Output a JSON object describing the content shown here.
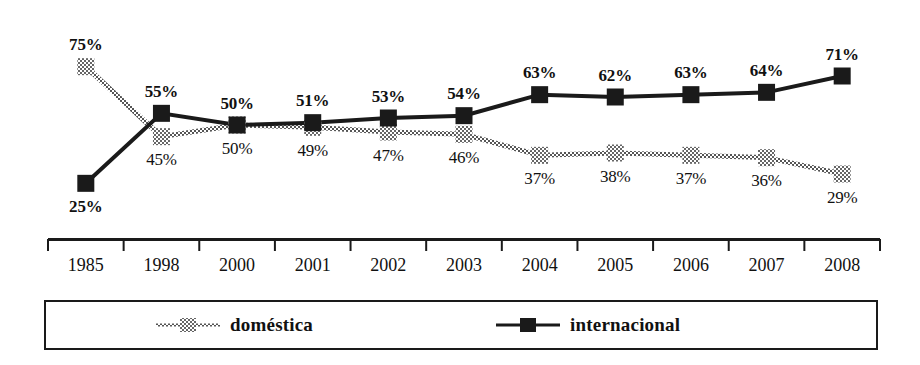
{
  "chart_data": {
    "type": "line",
    "title": "",
    "subtitle": "",
    "xlabel": "",
    "ylabel": "",
    "ylim": [
      20,
      80
    ],
    "grid": false,
    "legend_position": "bottom",
    "value_suffix": "%",
    "categories": [
      "1985",
      "1998",
      "2000",
      "2001",
      "2002",
      "2003",
      "2004",
      "2005",
      "2006",
      "2007",
      "2008"
    ],
    "series": [
      {
        "name": "doméstica",
        "marker": "hatched-square",
        "color": "#8a8a8a",
        "values": [
          75,
          45,
          50,
          49,
          47,
          46,
          37,
          38,
          37,
          36,
          29
        ],
        "labels": [
          "75%",
          "45%",
          "50%",
          "49%",
          "47%",
          "46%",
          "37%",
          "38%",
          "37%",
          "36%",
          "29%"
        ],
        "label_positions": [
          "above",
          "below",
          "below",
          "below",
          "below",
          "below",
          "below",
          "below",
          "below",
          "below",
          "below"
        ],
        "label_bold": [
          true,
          false,
          false,
          false,
          false,
          false,
          false,
          false,
          false,
          false,
          false
        ]
      },
      {
        "name": "internacional",
        "marker": "solid-square",
        "color": "#1a1a1a",
        "values": [
          25,
          55,
          50,
          51,
          53,
          54,
          63,
          62,
          63,
          64,
          71
        ],
        "labels": [
          "25%",
          "55%",
          "50%",
          "51%",
          "53%",
          "54%",
          "63%",
          "62%",
          "63%",
          "64%",
          "71%"
        ],
        "label_positions": [
          "below",
          "above",
          "above",
          "above",
          "above",
          "above",
          "above",
          "above",
          "above",
          "above",
          "above"
        ],
        "label_bold": [
          true,
          true,
          true,
          true,
          true,
          true,
          true,
          true,
          true,
          true,
          true
        ]
      }
    ]
  },
  "axis": {
    "tick_labels": [
      "1985",
      "1998",
      "2000",
      "2001",
      "2002",
      "2003",
      "2004",
      "2005",
      "2006",
      "2007",
      "2008"
    ]
  },
  "legend": {
    "items": [
      {
        "label": "doméstica",
        "marker": "hatched-square",
        "color": "#8a8a8a"
      },
      {
        "label": "internacional",
        "marker": "solid-square",
        "color": "#1a1a1a"
      }
    ]
  }
}
